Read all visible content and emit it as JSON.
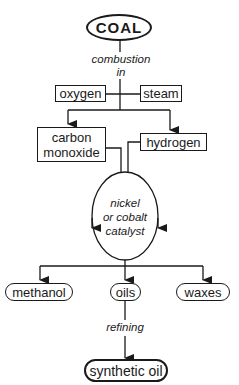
{
  "diagram": {
    "nodes": {
      "coal": "COAL",
      "oxygen": "oxygen",
      "steam": "steam",
      "carbon_monoxide_line1": "carbon",
      "carbon_monoxide_line2": "monoxide",
      "hydrogen": "hydrogen",
      "catalyst_line1": "nickel",
      "catalyst_line2": "or cobalt",
      "catalyst_line3": "catalyst",
      "methanol": "methanol",
      "oils": "oils",
      "waxes": "waxes",
      "synthetic_oil": "synthetic oil"
    },
    "edge_labels": {
      "combustion_line1": "combustion",
      "combustion_line2": "in",
      "refining": "refining"
    },
    "edges": [
      {
        "from": "COAL",
        "to": "oxygen/steam",
        "label": "combustion in"
      },
      {
        "from": "oxygen/steam",
        "to": "carbon monoxide"
      },
      {
        "from": "oxygen/steam",
        "to": "hydrogen"
      },
      {
        "from": "carbon monoxide",
        "to": "nickel or cobalt catalyst"
      },
      {
        "from": "hydrogen",
        "to": "nickel or cobalt catalyst"
      },
      {
        "from": "nickel or cobalt catalyst",
        "to": "methanol"
      },
      {
        "from": "nickel or cobalt catalyst",
        "to": "oils"
      },
      {
        "from": "nickel or cobalt catalyst",
        "to": "waxes"
      },
      {
        "from": "oils",
        "to": "synthetic oil",
        "label": "refining"
      }
    ]
  }
}
